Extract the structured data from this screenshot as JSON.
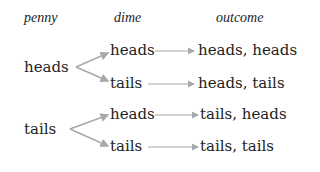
{
  "headers": {
    "penny": "penny",
    "dime": "dime",
    "outcome": "outcome"
  },
  "penny": [
    {
      "label": "heads",
      "dime": [
        {
          "label": "heads",
          "outcome": "heads, heads"
        },
        {
          "label": "tails",
          "outcome": "heads, tails"
        }
      ]
    },
    {
      "label": "tails",
      "dime": [
        {
          "label": "heads",
          "outcome": "tails, heads"
        },
        {
          "label": "tails",
          "outcome": "tails, tails"
        }
      ]
    }
  ],
  "colors": {
    "text": "#222222",
    "arrow": "#a9a9a9",
    "background": "#ffffff"
  }
}
